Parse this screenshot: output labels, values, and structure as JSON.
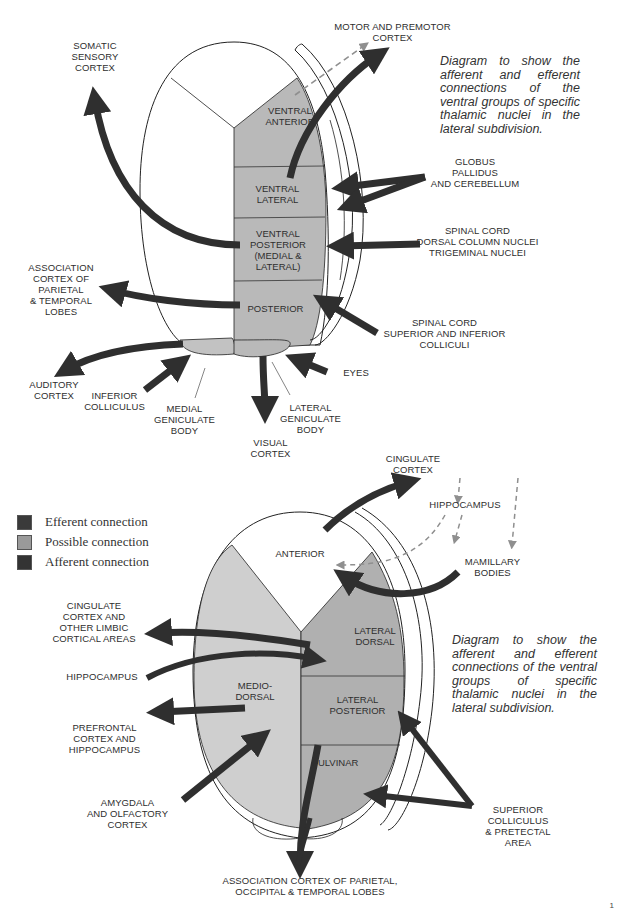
{
  "top_diagram": {
    "caption": "Diagram to show the afferent and efferent connections of the ventral groups of specific thalamic nuclei in the lateral subdivision.",
    "nuclei": [
      {
        "id": "ventral-anterior",
        "label": "VENTRAL\nANTERIOR"
      },
      {
        "id": "ventral-lateral",
        "label": "VENTRAL\nLATERAL"
      },
      {
        "id": "ventral-posterior",
        "label": "VENTRAL\nPOSTERIOR\n(MEDIAL &\nLATERAL)"
      },
      {
        "id": "posterior",
        "label": "POSTERIOR"
      }
    ],
    "targets": {
      "somatic_sensory": "SOMATIC\nSENSORY\nCORTEX",
      "motor_premotor": "MOTOR AND PREMOTOR\nCORTEX",
      "globus_pallidus": "GLOBUS\nPALLIDUS\nAND CEREBELLUM",
      "spinal_dorsal": "SPINAL CORD\nDORSAL COLUMN NUCLEI\nTRIGEMINAL NUCLEI",
      "association_parietal_temporal": "ASSOCIATION\nCORTEX OF\nPARIETAL\n& TEMPORAL\nLOBES",
      "spinal_colliculi": "SPINAL CORD\nSUPERIOR AND INFERIOR\nCOLLICULI",
      "auditory": "AUDITORY\nCORTEX",
      "inferior_colliculus": "INFERIOR\nCOLLICULUS",
      "medial_geniculate": "MEDIAL\nGENICULATE\nBODY",
      "eyes": "EYES",
      "lateral_geniculate": "LATERAL\nGENICULATE\nBODY",
      "visual": "VISUAL\nCORTEX"
    }
  },
  "legend": {
    "items": [
      {
        "label": "Efferent connection",
        "color": "#3a3a3a"
      },
      {
        "label": "Possible connection",
        "color": "#9a9a9a"
      },
      {
        "label": "Afferent connection",
        "color": "#333333"
      }
    ]
  },
  "bottom_diagram": {
    "caption": "Diagram to show the afferent and efferent connections of the ventral groups of specific thalamic nuclei in the lateral subdivision.",
    "nuclei": [
      {
        "id": "anterior",
        "label": "ANTERIOR"
      },
      {
        "id": "lateral-dorsal",
        "label": "LATERAL\nDORSAL"
      },
      {
        "id": "medio-dorsal",
        "label": "MEDIO-\nDORSAL"
      },
      {
        "id": "lateral-posterior",
        "label": "LATERAL\nPOSTERIOR"
      },
      {
        "id": "pulvinar",
        "label": "PULVINAR"
      }
    ],
    "targets": {
      "cingulate_cortex": "CINGULATE\nCORTEX",
      "hippocampus_top": "HIPPOCAMPUS",
      "mamillary": "MAMILLARY\nBODIES",
      "cingulate_limbic": "CINGULATE\nCORTEX AND\nOTHER LIMBIC\nCORTICAL AREAS",
      "hippocampus_left": "HIPPOCAMPUS",
      "prefrontal": "PREFRONTAL\nCORTEX AND\nHIPPOCAMPUS",
      "amygdala": "AMYGDALA\nAND OLFACTORY\nCORTEX",
      "superior_colliculus": "SUPERIOR\nCOLLICULUS\n& PRETECTAL\nAREA",
      "association_poc": "ASSOCIATION CORTEX OF  PARIETAL,\nOCCIPITAL & TEMPORAL LOBES"
    }
  },
  "colors": {
    "nucleus_gray": "#b9b9b9",
    "light_gray": "#cfcfcf",
    "arrow": "#2f2f2f",
    "dashed": "#8f8f8f"
  },
  "page_number": "1"
}
